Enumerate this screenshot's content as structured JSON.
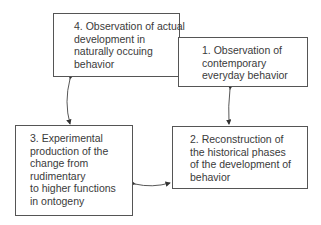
{
  "diagram": {
    "boxes": [
      {
        "id": "box4",
        "lines": [
          "4. Observation of actual",
          "development in",
          "naturally occuing",
          "behavior"
        ]
      },
      {
        "id": "box1",
        "lines": [
          "1. Observation of",
          "contemporary",
          "everyday behavior"
        ]
      },
      {
        "id": "box3",
        "lines": [
          "3. Experimental",
          "production of the",
          "change from",
          "rudimentary",
          "to higher functions",
          "in ontogeny"
        ]
      },
      {
        "id": "box2",
        "lines": [
          "2. Reconstruction of",
          "the historical phases",
          "of the development of",
          "behavior"
        ]
      }
    ],
    "connections": [
      {
        "from": "box4",
        "to": "box3",
        "type": "bidirectional"
      },
      {
        "from": "box1",
        "to": "box2",
        "type": "bidirectional"
      },
      {
        "from": "box3",
        "to": "box2",
        "type": "bidirectional"
      }
    ]
  }
}
